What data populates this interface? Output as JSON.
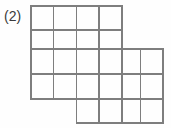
{
  "figure": {
    "label": "(2)",
    "caption_text": "(2)",
    "type": "polyomino-grid-diagram",
    "line_color": "#7e7e7e",
    "background_color": "#fefefe",
    "label_color": "#3a3a3a"
  },
  "grid": {
    "columns": 6,
    "rows": 5,
    "column_edges_px": [
      31,
      53.7,
      76.4,
      99.0,
      122.0,
      140.3,
      163.0
    ],
    "row_edges_px": [
      6,
      30,
      49,
      74,
      99,
      123
    ],
    "filled_cells": [
      [
        1,
        1,
        1,
        1,
        0,
        0
      ],
      [
        1,
        1,
        1,
        1,
        0,
        0
      ],
      [
        1,
        1,
        1,
        1,
        1,
        1
      ],
      [
        1,
        1,
        1,
        1,
        1,
        1
      ],
      [
        0,
        0,
        1,
        1,
        1,
        1
      ]
    ],
    "total_filled_cells": 24
  }
}
